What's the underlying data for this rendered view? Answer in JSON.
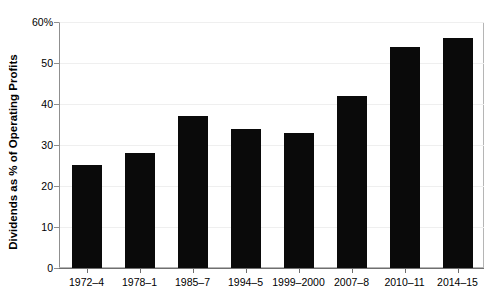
{
  "chart_data": {
    "type": "bar",
    "title": "",
    "xlabel": "",
    "ylabel": "Dividends as % of Operating Profits",
    "categories": [
      "1972–4",
      "1978–1",
      "1985–7",
      "1994–5",
      "1999–2000",
      "2007–8",
      "2010–11",
      "2014–15"
    ],
    "values": [
      25,
      28,
      37,
      34,
      33,
      42,
      54,
      56
    ],
    "ylim": [
      0,
      60
    ],
    "ytick_values": [
      0,
      10,
      20,
      30,
      40,
      50,
      60
    ],
    "ytick_labels": [
      "0",
      "10",
      "20",
      "30",
      "40",
      "50",
      "60%"
    ],
    "grid": true,
    "legend": false,
    "bar_color": "#0a0a0a",
    "background_color": "#ffffff",
    "axis_color": "#8f8f8f",
    "grid_color": "#efefef"
  }
}
